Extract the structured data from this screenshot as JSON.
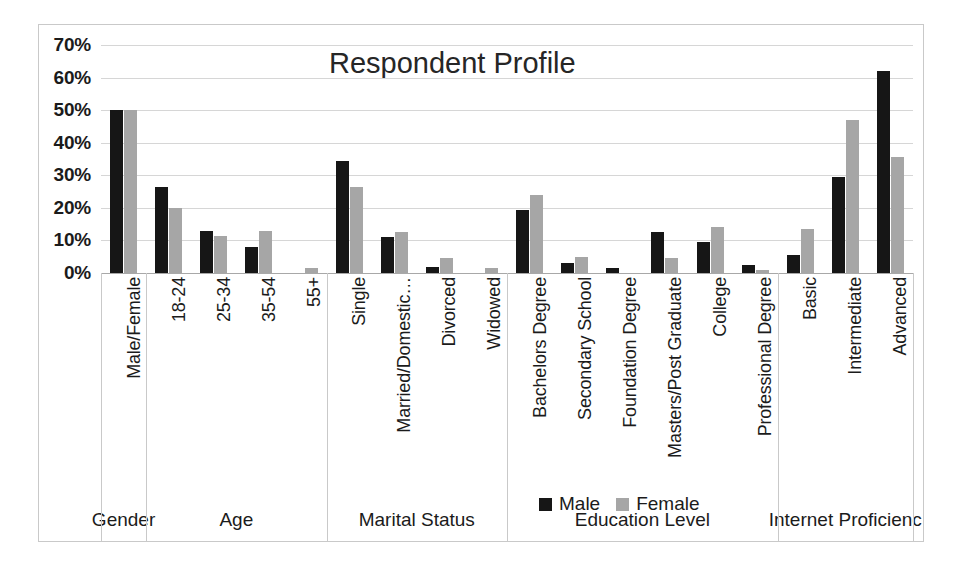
{
  "chart_data": {
    "type": "bar",
    "title": "Respondent Profile",
    "xlabel": "",
    "ylabel": "",
    "ylim": [
      0,
      70
    ],
    "grid": true,
    "legend_position": "bottom-center",
    "y_ticks": [
      "0%",
      "10%",
      "20%",
      "30%",
      "40%",
      "50%",
      "60%",
      "70%"
    ],
    "y_tick_values": [
      0,
      10,
      20,
      30,
      40,
      50,
      60,
      70
    ],
    "categories": [
      "Male/Female",
      "18-24",
      "25-34",
      "35-54",
      "55+",
      "Single",
      "Married/Domestic…",
      "Divorced",
      "Widowed",
      "Bachelors Degree",
      "Secondary School",
      "Foundation Degree",
      "Masters/Post Graduate",
      "College",
      "Professional Degree",
      "Basic",
      "Intermediate",
      "Advanced"
    ],
    "series": [
      {
        "name": "Male",
        "color": "#161616",
        "values": [
          50,
          26.5,
          13,
          8,
          0,
          34.5,
          11,
          2,
          0,
          19.5,
          3,
          1.5,
          12.5,
          9.5,
          2.5,
          5.5,
          29.5,
          62
        ]
      },
      {
        "name": "Female",
        "color": "#a6a6a6",
        "values": [
          50,
          20,
          11.5,
          13,
          1.5,
          26.5,
          12.5,
          4.5,
          1.5,
          24,
          5,
          0,
          4.5,
          14,
          1,
          13.5,
          47,
          35.5
        ]
      }
    ],
    "groups": [
      {
        "label": "Gender",
        "start": 0,
        "count": 1
      },
      {
        "label": "Age",
        "start": 1,
        "count": 4
      },
      {
        "label": "Marital Status",
        "start": 5,
        "count": 4
      },
      {
        "label": "Education Level",
        "start": 9,
        "count": 6
      },
      {
        "label": "Internet Proficienc",
        "start": 15,
        "count": 3
      }
    ]
  },
  "legend": {
    "entries": [
      {
        "label": "Male",
        "swatch": "male"
      },
      {
        "label": "Female",
        "swatch": "female"
      }
    ]
  },
  "colors": {
    "male": "#161616",
    "female": "#a6a6a6",
    "gridline": "#d6d6d6",
    "frame": "#c9c9c9",
    "text": "#1b1b1b",
    "background": "#ffffff"
  }
}
